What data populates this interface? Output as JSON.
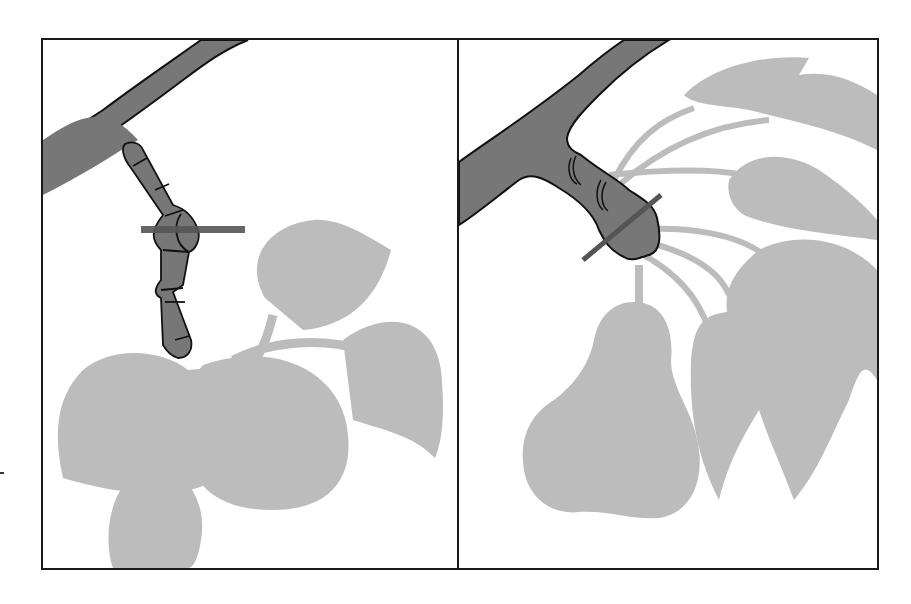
{
  "figure": {
    "panels": [
      {
        "id": "left",
        "subject": "leaf cluster on jointed spur",
        "cut_mark": "horizontal cut line across spur joint"
      },
      {
        "id": "right",
        "subject": "pear fruit and leaves on short swollen spur",
        "cut_mark": "diagonal cut line across swollen spur"
      }
    ],
    "colors": {
      "branch_fill": "#777777",
      "outline": "#111111",
      "foliage": "#bcbcbc",
      "cut_line": "#555555",
      "background": "#ffffff",
      "frame": "#1a1a1a"
    }
  }
}
